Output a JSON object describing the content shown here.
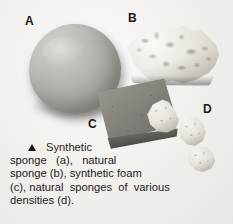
{
  "figure": {
    "alt_description": "Photograph of sponges and foam on a light background",
    "background_color": "#f4f3f1"
  },
  "labels": {
    "a": "A",
    "b": "B",
    "c": "C",
    "d": "D"
  },
  "objects": [
    {
      "label": "A",
      "name": "synthetic sponge ball",
      "color": "#a9a6a1"
    },
    {
      "label": "B",
      "name": "natural sponge",
      "color": "#e6e2db"
    },
    {
      "label": "C",
      "name": "synthetic foam block",
      "color": "#8a8781"
    },
    {
      "label": "D",
      "name": "natural sponge chunks",
      "color": "#e0dcd4"
    }
  ],
  "caption": {
    "marker": "triangle",
    "lines": [
      "Synthetic",
      "sponge   (a),   natural",
      "sponge (b), synthetic foam",
      "(c), natural  sponges  of  various",
      "densities (d)."
    ],
    "full_text": "Synthetic sponge (a), natural sponge (b), synthetic foam (c), natural sponges of various densities (d)."
  }
}
